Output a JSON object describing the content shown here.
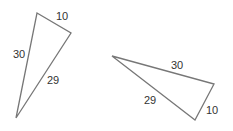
{
  "diagram": {
    "stroke_color": "#777777",
    "label_color": "#333333",
    "triangles": [
      {
        "name": "triangle-1",
        "vertices": [
          [
            37,
            13
          ],
          [
            71,
            33
          ],
          [
            16,
            118
          ]
        ],
        "sides": [
          {
            "label": "10",
            "x": 56,
            "y": 20
          },
          {
            "label": "30",
            "x": 13,
            "y": 58
          },
          {
            "label": "29",
            "x": 47,
            "y": 84
          }
        ]
      },
      {
        "name": "triangle-2",
        "vertices": [
          [
            112,
            56
          ],
          [
            214,
            84
          ],
          [
            195,
            120
          ]
        ],
        "sides": [
          {
            "label": "30",
            "x": 171,
            "y": 69
          },
          {
            "label": "29",
            "x": 144,
            "y": 104
          },
          {
            "label": "10",
            "x": 206,
            "y": 114
          }
        ]
      }
    ]
  }
}
